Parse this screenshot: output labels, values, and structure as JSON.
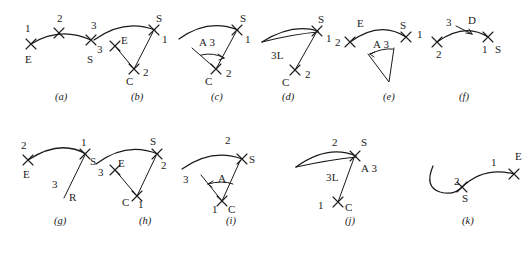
{
  "figure": {
    "background_color": "#ffffff",
    "ink_color": "#1a1a1a",
    "panel_count": 11
  },
  "panels": [
    {
      "id": "a",
      "caption": "(a)",
      "description": "Three-point arc: start, second point, end",
      "marks": [
        "1",
        "2",
        "3",
        "E",
        "S"
      ],
      "labels": {
        "n1": "1",
        "n2": "2",
        "n3": "3",
        "e": "E",
        "s": "S"
      }
    },
    {
      "id": "b",
      "caption": "(b)",
      "description": "Center, start, end arc with radial lines",
      "marks": [
        "3",
        "E",
        "S",
        "1",
        "C",
        "2"
      ],
      "labels": {
        "n3": "3",
        "e": "E",
        "s": "S",
        "n1": "1",
        "c": "C",
        "n2": "2"
      }
    },
    {
      "id": "c",
      "caption": "(c)",
      "description": "Center, start, included angle arc",
      "marks": [
        "S",
        "1",
        "A 3",
        "C",
        "2"
      ],
      "labels": {
        "s": "S",
        "n1": "1",
        "a3": "A 3",
        "c": "C",
        "n2": "2"
      }
    },
    {
      "id": "d",
      "caption": "(d)",
      "description": "Center, start, chord length arc",
      "marks": [
        "S",
        "1",
        "3L",
        "C",
        "2"
      ],
      "labels": {
        "s": "S",
        "n1": "1",
        "l3": "3L",
        "c": "C",
        "n2": "2"
      }
    },
    {
      "id": "e",
      "caption": "(e)",
      "description": "Start, end, included angle arc",
      "marks": [
        "E",
        "S",
        "1",
        "2",
        "A 3"
      ],
      "labels": {
        "e": "E",
        "s": "S",
        "n1": "1",
        "n2": "2",
        "a3": "A 3"
      }
    },
    {
      "id": "f",
      "caption": "(f)",
      "description": "Start, end, direction arc",
      "marks": [
        "3",
        "D",
        "S",
        "1",
        "2"
      ],
      "labels": {
        "n3": "3",
        "d": "D",
        "s": "S",
        "n1": "1",
        "n2": "2"
      }
    },
    {
      "id": "g",
      "caption": "(g)",
      "description": "Start, end, radius arc",
      "marks": [
        "2",
        "E",
        "1",
        "S",
        "3",
        "R"
      ],
      "labels": {
        "n2": "2",
        "e": "E",
        "n1": "1",
        "s": "S",
        "n3": "3",
        "r": "R"
      }
    },
    {
      "id": "h",
      "caption": "(h)",
      "description": "Start, center, end arc",
      "marks": [
        "S",
        "2",
        "E",
        "3",
        "C",
        "1"
      ],
      "labels": {
        "s": "S",
        "n2": "2",
        "e": "E",
        "n3": "3",
        "c": "C",
        "n1": "1"
      }
    },
    {
      "id": "i",
      "caption": "(i)",
      "description": "Start, center, included angle arc",
      "marks": [
        "2",
        "S",
        "3",
        "A",
        "1",
        "C"
      ],
      "labels": {
        "n2": "2",
        "s": "S",
        "n3": "3",
        "a": "A",
        "n1": "1",
        "c": "C"
      }
    },
    {
      "id": "j",
      "caption": "(j)",
      "description": "Start, center, chord length arc",
      "marks": [
        "2",
        "S",
        "A 3",
        "3L",
        "1",
        "C"
      ],
      "labels": {
        "n2": "2",
        "s": "S",
        "a3": "A 3",
        "l3": "3L",
        "n1": "1",
        "c": "C"
      }
    },
    {
      "id": "k",
      "caption": "(k)",
      "description": "Continuation arc from previous segment",
      "marks": [
        "2",
        "S",
        "1",
        "E"
      ],
      "labels": {
        "n2": "2",
        "s": "S",
        "n1": "1",
        "e": "E"
      }
    }
  ]
}
